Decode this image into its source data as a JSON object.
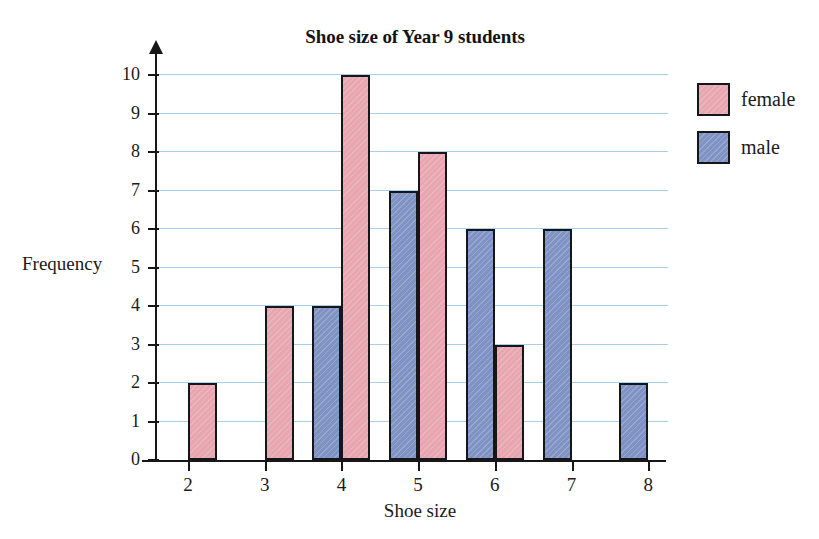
{
  "chart_data": {
    "type": "bar",
    "title": "Shoe size of Year 9 students",
    "xlabel": "Shoe size",
    "ylabel": "Frequency",
    "categories": [
      "2",
      "3",
      "4",
      "5",
      "6",
      "7",
      "8"
    ],
    "series": [
      {
        "name": "female",
        "color": "#e8a6b0",
        "values": [
          2,
          4,
          10,
          8,
          3,
          0,
          0
        ]
      },
      {
        "name": "male",
        "color": "#7f92c4",
        "values": [
          0,
          0,
          4,
          7,
          6,
          6,
          2
        ]
      }
    ],
    "ylim": [
      0,
      10
    ],
    "ytick_labels": [
      "10",
      "9",
      "8",
      "7",
      "6",
      "5",
      "4",
      "3",
      "2",
      "1",
      "0"
    ],
    "xtick_labels": [
      "2",
      "3",
      "4",
      "5",
      "6",
      "7",
      "8"
    ],
    "grid": true,
    "grid_color": "#a9cfe8",
    "legend_position": "right",
    "legend_entries": [
      "female",
      "male"
    ],
    "bar_outline_color": "#16161a"
  },
  "legend": {
    "items": [
      {
        "label": "female",
        "swatch": "female-swatch"
      },
      {
        "label": "male",
        "swatch": "male-swatch"
      }
    ]
  },
  "axes": {
    "y_title": "Frequency",
    "x_title": "Shoe size"
  }
}
